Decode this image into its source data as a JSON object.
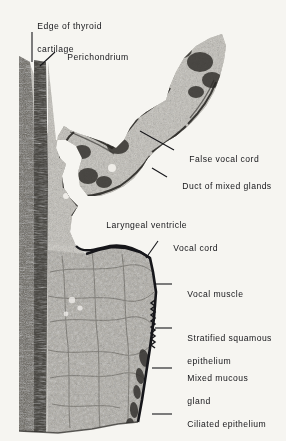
{
  "figure": {
    "kind": "histology-micrograph",
    "background_color": "#f6f5f1",
    "ink_color": "#16161a",
    "tissue_tone_light": "#b9b6ae",
    "tissue_tone_mid": "#8d8a82",
    "tissue_tone_dark": "#3c3a36"
  },
  "labels": [
    {
      "id": "edge-of-thyroid-cartilage",
      "line1": "Edge of thyroid",
      "line2": "cartilage",
      "x": 26,
      "y": 10
    },
    {
      "id": "perichondrium",
      "line1": "Perichondrium",
      "line2": "",
      "x": 56,
      "y": 41
    },
    {
      "id": "false-vocal-cord",
      "line1": "False vocal cord",
      "line2": "",
      "x": 178,
      "y": 148
    },
    {
      "id": "duct-of-mixed-glands",
      "line1": "Duct of mixed glands",
      "line2": "",
      "x": 171,
      "y": 175
    },
    {
      "id": "laryngeal-ventricle",
      "line1": "Laryngeal ventricle",
      "line2": "",
      "x": 95,
      "y": 214
    },
    {
      "id": "vocal-cord",
      "line1": "Vocal cord",
      "line2": "",
      "x": 162,
      "y": 237
    },
    {
      "id": "vocal-muscle",
      "line1": "Vocal muscle",
      "line2": "",
      "x": 176,
      "y": 281
    },
    {
      "id": "stratified-squamous-epithelium",
      "line1": "Stratified squamous",
      "line2": "epithelium",
      "x": 176,
      "y": 325
    },
    {
      "id": "mixed-mucous-gland",
      "line1": "Mixed mucous",
      "line2": "gland",
      "x": 176,
      "y": 365
    },
    {
      "id": "ciliated-epithelium",
      "line1": "Ciliated epithelium",
      "line2": "",
      "x": 176,
      "y": 411
    }
  ],
  "leaders": [
    {
      "id": "leader-edge-of-thyroid-cartilage",
      "x1": 32,
      "y1": 32,
      "x2": 32,
      "y2": 62
    },
    {
      "id": "leader-perichondrium",
      "x1": 55,
      "y1": 52,
      "x2": 40,
      "y2": 66
    },
    {
      "id": "leader-false-vocal-cord",
      "x1": 174,
      "y1": 150,
      "x2": 140,
      "y2": 131
    },
    {
      "id": "leader-duct-of-mixed-glands",
      "x1": 167,
      "y1": 177,
      "x2": 152,
      "y2": 168
    },
    {
      "id": "leader-vocal-cord",
      "x1": 158,
      "y1": 241,
      "x2": 146,
      "y2": 258
    },
    {
      "id": "leader-vocal-muscle",
      "x1": 172,
      "y1": 284,
      "x2": 155,
      "y2": 284
    },
    {
      "id": "leader-stratified-squamous-epithelium",
      "x1": 172,
      "y1": 328,
      "x2": 155,
      "y2": 328
    },
    {
      "id": "leader-mixed-mucous-gland",
      "x1": 172,
      "y1": 368,
      "x2": 152,
      "y2": 368
    },
    {
      "id": "leader-ciliated-epithelium",
      "x1": 172,
      "y1": 414,
      "x2": 152,
      "y2": 414
    }
  ]
}
